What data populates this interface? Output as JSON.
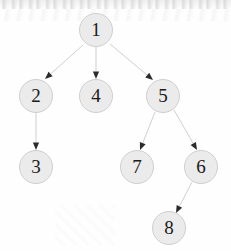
{
  "diagram": {
    "type": "directed-graph",
    "canvas": {
      "width": 231,
      "height": 251
    },
    "style": {
      "background_color": "#fefefe",
      "node_fill": "#ebebeb",
      "node_stroke": "#cfcfcf",
      "node_text_color": "#1a1a1a",
      "edge_color": "#c9c9c9",
      "arrowhead_color": "#2b2b2b",
      "node_diameter": 34
    },
    "nodes": [
      {
        "id": "1",
        "label": "1",
        "cx": 96,
        "cy": 30,
        "d": 34
      },
      {
        "id": "2",
        "label": "2",
        "cx": 36,
        "cy": 96,
        "d": 34
      },
      {
        "id": "4",
        "label": "4",
        "cx": 96,
        "cy": 96,
        "d": 34
      },
      {
        "id": "5",
        "label": "5",
        "cx": 163,
        "cy": 96,
        "d": 34
      },
      {
        "id": "3",
        "label": "3",
        "cx": 36,
        "cy": 167,
        "d": 34
      },
      {
        "id": "7",
        "label": "7",
        "cx": 137,
        "cy": 167,
        "d": 34
      },
      {
        "id": "6",
        "label": "6",
        "cx": 201,
        "cy": 167,
        "d": 34
      },
      {
        "id": "8",
        "label": "8",
        "cx": 169,
        "cy": 228,
        "d": 34
      }
    ],
    "edges": [
      {
        "from": "1",
        "to": "2",
        "x1": 83,
        "y1": 45,
        "x2": 45,
        "y2": 79
      },
      {
        "from": "1",
        "to": "4",
        "x1": 96,
        "y1": 47,
        "x2": 96,
        "y2": 79
      },
      {
        "from": "1",
        "to": "5",
        "x1": 110,
        "y1": 44,
        "x2": 153,
        "y2": 80
      },
      {
        "from": "2",
        "to": "3",
        "x1": 36,
        "y1": 113,
        "x2": 36,
        "y2": 150
      },
      {
        "from": "5",
        "to": "7",
        "x1": 155,
        "y1": 112,
        "x2": 140,
        "y2": 150
      },
      {
        "from": "5",
        "to": "6",
        "x1": 174,
        "y1": 110,
        "x2": 197,
        "y2": 150
      },
      {
        "from": "6",
        "to": "8",
        "x1": 192,
        "y1": 182,
        "x2": 176,
        "y2": 213
      }
    ]
  }
}
